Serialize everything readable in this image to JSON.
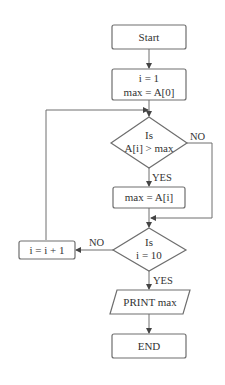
{
  "diagram": {
    "type": "flowchart",
    "nodes": {
      "start": {
        "label": "Start"
      },
      "init": {
        "line1": "i = 1",
        "line2": "max = A[0]"
      },
      "compare": {
        "line1": "Is",
        "line2": "A[i] > max"
      },
      "assign": {
        "label": "max = A[i]"
      },
      "check_end": {
        "line1": "Is",
        "line2": "i = 10"
      },
      "increment": {
        "label": "i = i + 1"
      },
      "print": {
        "label": "PRINT max"
      },
      "end": {
        "label": "END"
      }
    },
    "edges": {
      "compare_yes": "YES",
      "compare_no": "NO",
      "check_yes": "YES",
      "check_no": "NO"
    },
    "colors": {
      "stroke": "#6e6e6e",
      "text": "#333333",
      "background": "#ffffff"
    }
  }
}
